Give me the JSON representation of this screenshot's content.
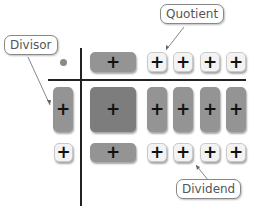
{
  "diagram": {
    "labels": {
      "quotient": "Quotient",
      "divisor": "Divisor",
      "dividend": "Dividend"
    },
    "tile_symbol": "+",
    "colors": {
      "x_squared_tile": "#7d7d7d",
      "x_tile": "#949494",
      "unit_tile": "#f3f3f3",
      "axis_lines": "#222222",
      "origin_dot": "#8a8a8a"
    },
    "quotient_row": [
      "x",
      "1",
      "1",
      "1",
      "1"
    ],
    "divisor_column": [
      "x",
      "1"
    ],
    "dividend_rows": [
      [
        "x^2",
        "x",
        "x",
        "x",
        "x"
      ],
      [
        "x",
        "1",
        "1",
        "1",
        "1"
      ]
    ]
  }
}
